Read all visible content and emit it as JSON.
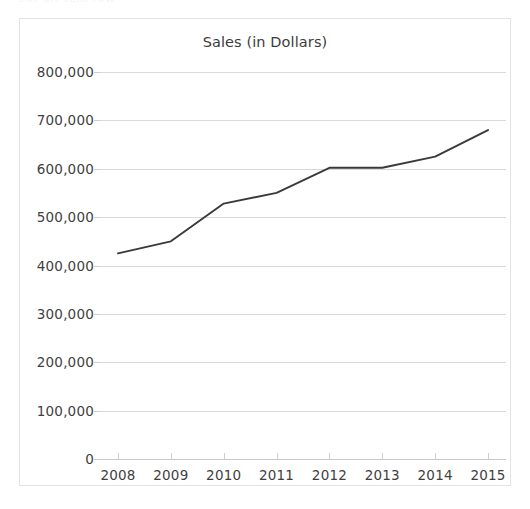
{
  "top_artifact": {
    "text": "cut-off text row"
  },
  "chart": {
    "title": "Sales (in Dollars)",
    "axis_color": "#c9c9c9",
    "grid_color": "#d9d9d9",
    "line_color": "#3a3a3a",
    "border_color": "#e2e3e5",
    "text_color": "#3f3f3f"
  },
  "chart_data": {
    "type": "line",
    "title": "Sales (in Dollars)",
    "xlabel": "",
    "ylabel": "",
    "categories": [
      "2008",
      "2009",
      "2010",
      "2011",
      "2012",
      "2013",
      "2014",
      "2015"
    ],
    "values": [
      425000,
      450000,
      528000,
      550000,
      602000,
      602000,
      625000,
      680000
    ],
    "ylim": [
      0,
      800000
    ],
    "yticks": [
      0,
      100000,
      200000,
      300000,
      400000,
      500000,
      600000,
      700000,
      800000
    ],
    "ytick_labels": [
      "0",
      "100,000",
      "200,000",
      "300,000",
      "400,000",
      "500,000",
      "600,000",
      "700,000",
      "800,000"
    ],
    "xtick_labels": [
      "2008",
      "2009",
      "2010",
      "2011",
      "2012",
      "2013",
      "2014",
      "2015"
    ],
    "grid": "horizontal",
    "legend": "none",
    "markers": "none",
    "series": [
      {
        "name": "Sales",
        "values": [
          425000,
          450000,
          528000,
          550000,
          602000,
          602000,
          625000,
          680000
        ]
      }
    ]
  }
}
